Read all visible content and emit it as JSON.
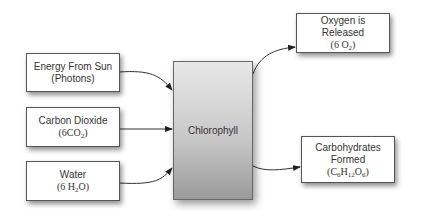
{
  "diagram": {
    "type": "flow",
    "inputs": [
      {
        "id": "energy",
        "label": "Energy From Sun",
        "sub": "(Photons)"
      },
      {
        "id": "co2",
        "label": "Carbon Dioxide",
        "formula": [
          "(6CO",
          "2",
          ")"
        ]
      },
      {
        "id": "water",
        "label": "Water",
        "formula": [
          "(6 H",
          "2",
          "O)"
        ]
      }
    ],
    "center": {
      "id": "chlorophyll",
      "label": "Chlorophyll"
    },
    "outputs": [
      {
        "id": "oxygen",
        "label_line1": "Oxygen is",
        "label_line2": "Released",
        "formula": [
          "(6 O",
          "2",
          ")"
        ]
      },
      {
        "id": "carbs",
        "label_line1": "Carbohydrates",
        "label_line2": "Formed",
        "formula": [
          "(C",
          "6",
          "H",
          "12",
          "O",
          "6",
          ")"
        ]
      }
    ],
    "edges": [
      {
        "from": "energy",
        "to": "chlorophyll"
      },
      {
        "from": "co2",
        "to": "chlorophyll"
      },
      {
        "from": "water",
        "to": "chlorophyll"
      },
      {
        "from": "chlorophyll",
        "to": "oxygen"
      },
      {
        "from": "chlorophyll",
        "to": "carbs"
      }
    ]
  }
}
